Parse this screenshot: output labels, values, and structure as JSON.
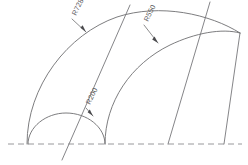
{
  "drawing": {
    "title": "Radius dimension drawing",
    "background_color": "#ffffff",
    "line_color": "#6e6e70",
    "text_color": "#5b5b5e",
    "centerline_color": "#8d8d90",
    "dimensions": [
      {
        "id": "outer-arc",
        "label": "R728",
        "rotation_deg": -64,
        "label_x": 76,
        "label_y": 16,
        "leader_start_x": 72,
        "leader_start_y": 19,
        "arrow_x": 86,
        "arrow_y": 32
      },
      {
        "id": "middle-arc",
        "label": "R550",
        "rotation_deg": -64,
        "label_x": 148,
        "label_y": 22,
        "leader_start_x": 144,
        "leader_start_y": 25,
        "arrow_x": 158,
        "arrow_y": 43
      },
      {
        "id": "inner-arc",
        "label": "R200",
        "rotation_deg": -64,
        "label_x": 90,
        "label_y": 105,
        "leader_start_x": 86,
        "leader_start_y": 108,
        "arrow_x": 93,
        "arrow_y": 116
      }
    ],
    "centerline": {
      "x1": 8,
      "y1": 144,
      "x2": 242,
      "y2": 144
    },
    "arcs": [
      {
        "id": "outer-arc-path",
        "d": "M 27 144 C 27 86 68 34 117 17 C 160 3 210 14 240 33"
      },
      {
        "id": "middle-arc-path",
        "d": "M 105 144 C 105 102 131 64 170 45 C 195 33 222 28 240 33"
      },
      {
        "id": "inner-arc-path",
        "d": "M 28 144 C 28 127 46 113 66 113 C 87 113 105 127 105 144"
      }
    ],
    "radial_lines": [
      {
        "id": "radial-left",
        "x1": 62,
        "y1": 160,
        "x2": 130,
        "y2": 5
      },
      {
        "id": "radial-mid",
        "x1": 168,
        "y1": 144,
        "x2": 210,
        "y2": 2
      },
      {
        "id": "radial-right",
        "x1": 224,
        "y1": 144,
        "x2": 240,
        "y2": 33
      }
    ]
  }
}
